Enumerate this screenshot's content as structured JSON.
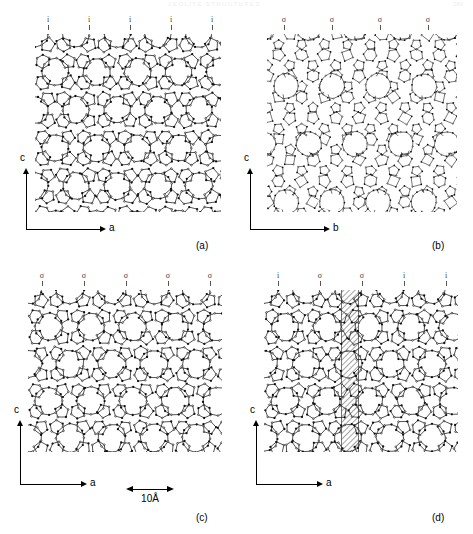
{
  "header": {
    "running_head": "ZEOLITE STRUCTURES",
    "page_number": "189"
  },
  "figure": {
    "scalebar": {
      "label": "10Å",
      "length_angstrom": 10
    },
    "panels": [
      {
        "id": "a",
        "caption": "(a)",
        "markers": [
          "i",
          "i",
          "i",
          "i",
          "i"
        ],
        "axis_vertical": "c",
        "axis_horizontal": "a",
        "projection": "polymorph A, projected along b",
        "style": "open",
        "has_fault_stripe": false
      },
      {
        "id": "b",
        "caption": "(b)",
        "markers": [
          "σ",
          "σ",
          "σ",
          "σ"
        ],
        "axis_vertical": "c",
        "axis_horizontal": "b",
        "projection": "polymorph B, projected along a",
        "style": "dense",
        "has_fault_stripe": false
      },
      {
        "id": "c",
        "caption": "(c)",
        "markers": [
          "σ",
          "σ",
          "σ",
          "σ",
          "σ"
        ],
        "axis_vertical": "c",
        "axis_horizontal": "a",
        "projection": "polymorph B, projected along b",
        "style": "open",
        "has_fault_stripe": false
      },
      {
        "id": "d",
        "caption": "(d)",
        "markers": [
          "i",
          "σ",
          "σ",
          "i",
          "i"
        ],
        "axis_vertical": "c",
        "axis_horizontal": "a",
        "projection": "faulted intergrowth, projected along b",
        "style": "open",
        "has_fault_stripe": true,
        "fault_stripe_note": "hatched stacking-fault slab"
      }
    ]
  },
  "colors": {
    "ink": "#111111",
    "axis": "#000000",
    "marker": "#3a3a3a",
    "background": "#ffffff",
    "fault_hatch": "#555555"
  }
}
